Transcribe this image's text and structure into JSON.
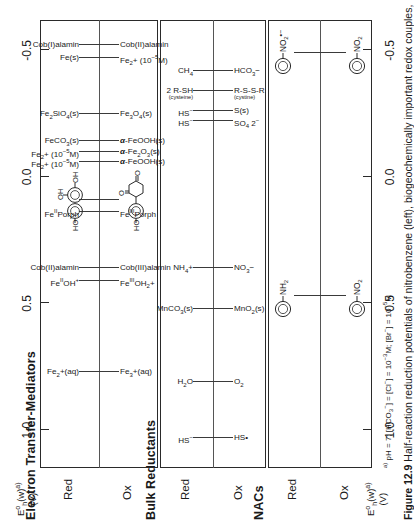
{
  "figure": {
    "number": "Figure 12.9",
    "caption": "Half-reaction reduction potentials of nitrobenzene (left), biogeochemically important redox couples,",
    "footnote": "pH = 7; [HCO3−] = [Cl−] = 10−3M; [Br−] = 10−5M",
    "footnote_marker": "a)"
  },
  "axis": {
    "label_main": "E",
    "label_sup": "o",
    "label_sub": "h",
    "label_paren": "(w)",
    "label_marker": "a)",
    "unit": "(V)",
    "ticks": [
      "1.0",
      "0.5",
      "0.0",
      "-0.5"
    ],
    "tick_values": [
      1.0,
      0.5,
      0.0,
      -0.5
    ],
    "range": [
      1.15,
      -0.62
    ]
  },
  "panels": [
    {
      "id": "nacs",
      "title": "NACs",
      "columns": [
        "Ox",
        "Red"
      ],
      "couples": [
        {
          "potential": 0.47,
          "ox": "nitrobenzene",
          "red": "aniline",
          "ox_type": "molecule-nitrobenzene",
          "red_type": "molecule-aniline",
          "ox_text": "NO2",
          "red_text": "NH2"
        },
        {
          "potential": -0.49,
          "ox": "nitrobenzene",
          "red": "nitrobenzene radical anion",
          "ox_type": "molecule-nitrobenzene",
          "red_type": "molecule-nitro-radical",
          "ox_text": "NO2",
          "red_text": "NO2•−"
        }
      ]
    },
    {
      "id": "bulk-reductants",
      "title": "Bulk Reductants",
      "columns": [
        "Ox",
        "Red"
      ],
      "couples": [
        {
          "potential": 1.03,
          "ox": "HS•",
          "red": "HS−"
        },
        {
          "potential": 0.81,
          "ox": "O2",
          "red": "H2O"
        },
        {
          "potential": 0.52,
          "ox": "MnO2(s)",
          "red": "MnCO3(s)"
        },
        {
          "potential": 0.36,
          "ox": "NO3−",
          "red": "NH4+"
        },
        {
          "potential": -0.22,
          "ox": "SO4 2−",
          "red": "HS−"
        },
        {
          "potential": -0.26,
          "ox": "S(s)",
          "red": "HS−"
        },
        {
          "potential": -0.34,
          "ox": "R-S-S-R (cystine)",
          "red": "2 R-SH (cysteine)"
        },
        {
          "potential": -0.42,
          "ox": "HCO3−",
          "red": "CH4"
        }
      ]
    },
    {
      "id": "electron-transfer-mediators",
      "title": "Electron Transfer-Mediators",
      "columns": [
        "Ox",
        "Red"
      ],
      "couples": [
        {
          "potential": 0.77,
          "ox": "Fe3+(aq)",
          "red": "Fe2+(aq)"
        },
        {
          "potential": 0.41,
          "ox": "FeIIIOH2+",
          "red": "FeIIOH+"
        },
        {
          "potential": 0.36,
          "ox": "Cob(III)alamin",
          "red": "Cob(II)alamin"
        },
        {
          "potential": 0.14,
          "ox": "FeIIIPorph",
          "red": "FeIIPorph"
        },
        {
          "potential": 0.09,
          "ox": "juglone",
          "red": "juglone-hydroquinone",
          "ox_type": "molecule-juglone-quinone",
          "red_type": "molecule-juglone-hydroquinone"
        },
        {
          "potential": -0.06,
          "ox": "α-FeOOH(s)",
          "red": "Fe2+ (10−5M)"
        },
        {
          "potential": -0.1,
          "ox": "α-Fe2O3(s)",
          "red": "Fe2+ (10−5M)"
        },
        {
          "potential": -0.14,
          "ox": "α-FeOOH(s)",
          "red": "FeCO3(s)"
        },
        {
          "potential": -0.25,
          "ox": "Fe3O4(s)",
          "red": "Fe2SiO4(s)"
        },
        {
          "potential": -0.47,
          "ox": "Fe2+ (10−5M)",
          "red": "Fe(s)"
        },
        {
          "potential": -0.52,
          "ox": "Cob(II)alamin",
          "red": "Cob(I)alamin"
        }
      ]
    }
  ]
}
